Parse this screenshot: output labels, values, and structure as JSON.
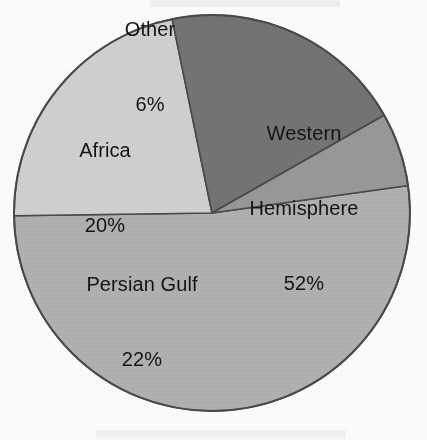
{
  "chart_data": {
    "type": "pie",
    "title": "",
    "subtitle": "",
    "xlabel": "",
    "ylabel": "",
    "legend": "none",
    "grid": false,
    "labels_inside_slices": true,
    "total_percent": 100,
    "categories": [
      "Western Hemisphere",
      "Persian Gulf",
      "Africa",
      "Other"
    ],
    "values": [
      52,
      22,
      20,
      6
    ],
    "slices": [
      {
        "name": "Western Hemisphere",
        "label": "Western\nHemisphere",
        "label_line1": "Western",
        "label_line2": "Hemisphere",
        "value": 52,
        "value_text": "52%",
        "color": "#b2b2b2",
        "start_angle_deg": -8,
        "end_angle_deg": 179.2,
        "label_x": 304,
        "label_y": 208
      },
      {
        "name": "Persian Gulf",
        "label": "Persian Gulf",
        "label_line1": "Persian Gulf",
        "label_line2": "",
        "value": 22,
        "value_text": "22%",
        "color": "#d2d2d2",
        "start_angle_deg": 179.2,
        "end_angle_deg": 258.4,
        "label_x": 142,
        "label_y": 322
      },
      {
        "name": "Africa",
        "label": "Africa",
        "label_line1": "Africa",
        "label_line2": "",
        "value": 20,
        "value_text": "20%",
        "color": "#757575",
        "start_angle_deg": 258.4,
        "end_angle_deg": 330.4,
        "label_x": 105,
        "label_y": 188
      },
      {
        "name": "Other",
        "label": "Other",
        "label_line1": "Other",
        "label_line2": "",
        "value": 6,
        "value_text": "6%",
        "color": "#9a9a9a",
        "start_angle_deg": 330.4,
        "end_angle_deg": 352,
        "label_x": 150,
        "label_y": 67
      }
    ],
    "geometry": {
      "center_x": 212,
      "center_y": 213,
      "radius": 198,
      "outline_color": "#4a4a4a",
      "background": "#ffffff"
    }
  }
}
